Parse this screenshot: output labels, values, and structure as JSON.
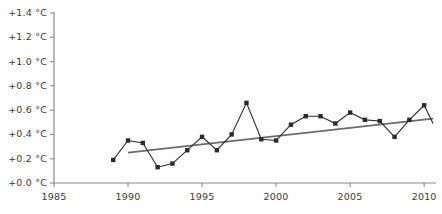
{
  "chart_data": {
    "type": "line",
    "title": "",
    "xlabel": "",
    "ylabel": "",
    "xlim": [
      1985,
      2010.8
    ],
    "ylim": [
      0.0,
      1.4
    ],
    "grid": false,
    "legend": "none",
    "yticks": [
      0.0,
      0.2,
      0.4,
      0.6,
      0.8,
      1.0,
      1.2,
      1.4
    ],
    "ytick_labels": [
      "+0.0 °C",
      "+0.2 °C",
      "+0.4 °C",
      "+0.6 °C",
      "+0.8 °C",
      "+1.0 °C",
      "+1.2 °C",
      "+1.4 °C"
    ],
    "xticks": [
      1985,
      1990,
      1995,
      2000,
      2005,
      2010
    ],
    "xtick_labels": [
      "1985",
      "1990",
      "1995",
      "2000",
      "2005",
      "2010"
    ],
    "x": [
      1989,
      1990,
      1991,
      1992,
      1993,
      1994,
      1995,
      1996,
      1997,
      1998,
      1999,
      2000,
      2001,
      2002,
      2003,
      2004,
      2005,
      2006,
      2007,
      2008,
      2009,
      2010
    ],
    "series": [
      {
        "name": "Annual temperature anomaly",
        "marker": "square",
        "color": "#2b2b2b",
        "values": [
          0.19,
          0.35,
          0.33,
          0.13,
          0.16,
          0.27,
          0.38,
          0.27,
          0.4,
          0.66,
          0.36,
          0.35,
          0.48,
          0.55,
          0.55,
          0.49,
          0.58,
          0.52,
          0.51,
          0.38,
          0.52,
          0.64
        ]
      },
      {
        "name": "Trend line",
        "marker": "none",
        "color": "#6b6b6b",
        "x": [
          1990.0,
          2010.6
        ],
        "values": [
          0.25,
          0.53
        ]
      }
    ],
    "tail_segment": {
      "x": [
        2010,
        2010.6
      ],
      "values": [
        0.64,
        0.49
      ]
    }
  },
  "axis": {
    "line_color": "#8a8a8a",
    "tick_color": "#8a8a8a",
    "label_color": "#3a3a3a"
  }
}
